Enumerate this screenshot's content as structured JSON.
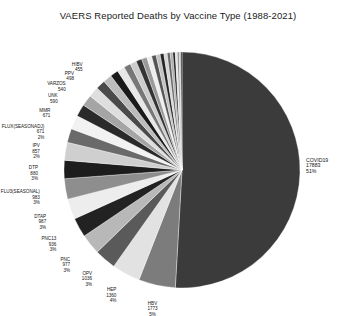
{
  "chart_data": {
    "type": "pie",
    "title": "VAERS Reported Deaths by Vaccine Type (1988-2021)",
    "xlabel": "",
    "ylabel": "",
    "legend": false,
    "grid": false,
    "label_format": "name / value / percent",
    "total": 35000,
    "categories": [
      "COVID19",
      "HBV",
      "HEP",
      "OPV",
      "PNC",
      "PNC13",
      "DTAP",
      "FLU3(SEASONAL)",
      "DTP",
      "IPV",
      "FLUX(SEASONADJ)",
      "MMR",
      "UNK",
      "VARZOS",
      "PPV",
      "HIBV",
      "FLU4",
      "MENB",
      "RV",
      "TDAP",
      "HPV4",
      "MNQ",
      "RVX",
      "DT",
      "TD",
      "FLUN",
      "HEPAB",
      "VARCEL",
      "MEN",
      "RAB",
      "TYP",
      "SMALL",
      "JEV",
      "BCG",
      "ANTH"
    ],
    "values": [
      17883,
      1773,
      1360,
      1036,
      977,
      936,
      987,
      983,
      880,
      857,
      671,
      671,
      590,
      540,
      498,
      455,
      420,
      390,
      360,
      330,
      305,
      280,
      258,
      236,
      215,
      196,
      178,
      160,
      144,
      128,
      113,
      99,
      86,
      74,
      63
    ],
    "percents": [
      "51%",
      "5%",
      "4%",
      "3%",
      "3%",
      "3%",
      "3%",
      "3%",
      "3%",
      "2%",
      "2%",
      "2%",
      "2%",
      "2%",
      "1%",
      "1%",
      "1%",
      "1%",
      "1%",
      "1%",
      "1%",
      "1%",
      "1%",
      "1%",
      "1%",
      "1%",
      "1%",
      "0%",
      "0%",
      "0%",
      "0%",
      "0%",
      "0%",
      "0%",
      "0%"
    ],
    "colors": [
      "#3b3b3b",
      "#7c7c7c",
      "#e2e2e2",
      "#5a5a5a",
      "#b8b8b8",
      "#222222",
      "#ededed",
      "#8e8e8e",
      "#1d1d1d",
      "#cfcfcf",
      "#6a6a6a",
      "#f2f2f2",
      "#2a2a2a",
      "#a5a5a5",
      "#dedede",
      "#4a4a4a",
      "#bcbcbc",
      "#1a1a1a",
      "#e8e8e8",
      "#777777",
      "#cccccc",
      "#333333",
      "#9a9a9a",
      "#efefef",
      "#555555",
      "#c2c2c2",
      "#242424",
      "#d6d6d6",
      "#666666",
      "#aeaeae",
      "#1f1f1f",
      "#e5e5e5",
      "#848484",
      "#c9c9c9",
      "#2e2e2e"
    ],
    "labeled_slices": [
      {
        "name": "COVID19",
        "value": "17883",
        "percent": "51%"
      },
      {
        "name": "HBV",
        "value": "1773",
        "percent": "5%"
      },
      {
        "name": "HEP",
        "value": "1360",
        "percent": "4%"
      },
      {
        "name": "OPV",
        "value": "1036",
        "percent": "3%"
      },
      {
        "name": "PNC",
        "value": "977",
        "percent": "3%"
      },
      {
        "name": "PNC13",
        "value": "936",
        "percent": "3%"
      },
      {
        "name": "DTAP",
        "value": "987",
        "percent": "3%"
      },
      {
        "name": "FLU3(SEASONAL)",
        "value": "983",
        "percent": "3%"
      },
      {
        "name": "DTP",
        "value": "880",
        "percent": "3%"
      },
      {
        "name": "IPV",
        "value": "857",
        "percent": "2%"
      },
      {
        "name": "FLUX(SEASONADJ)",
        "value": "671",
        "percent": "2%"
      },
      {
        "name": "MMR",
        "value": "671",
        "percent": ""
      },
      {
        "name": "UNK",
        "value": "590",
        "percent": ""
      },
      {
        "name": "VARZOS",
        "value": "540",
        "percent": ""
      },
      {
        "name": "PPV",
        "value": "498",
        "percent": ""
      },
      {
        "name": "HIBV",
        "value": "455",
        "percent": ""
      }
    ]
  }
}
